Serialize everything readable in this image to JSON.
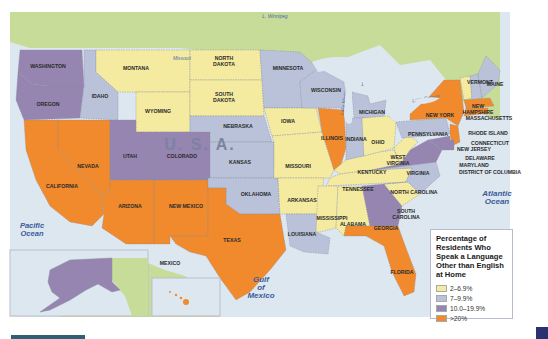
{
  "map": {
    "country_label": "U. S. A.",
    "neighbor_labels": {
      "canada_lake": "L. Winnipeg",
      "mexico": "MEXICO"
    },
    "water_labels": [
      {
        "id": "pacific",
        "text": [
          "Pacific",
          "Ocean"
        ]
      },
      {
        "id": "atlantic",
        "text": [
          "Atlantic",
          "Ocean"
        ]
      },
      {
        "id": "gulf",
        "text": [
          "Gulf",
          "of",
          "Mexico"
        ]
      }
    ],
    "lakes": [
      "Lake Superior",
      "Lake Michigan",
      "Lake Huron",
      "Lake Ontario",
      "Lake Erie"
    ],
    "river": "Missouri",
    "colors": {
      "land_other": "#c6dc98",
      "water": "#dde7f0",
      "border": "#8a8f9c"
    }
  },
  "legend": {
    "title": "Percentage of Residents Who Speak a Language Other than English at Home",
    "categories": [
      {
        "id": "c1",
        "label": "2–6.9%",
        "color": "#f5eba0"
      },
      {
        "id": "c2",
        "label": "7–9.9%",
        "color": "#b9c2d9"
      },
      {
        "id": "c3",
        "label": "10.0–19.9%",
        "color": "#9585b0"
      },
      {
        "id": "c4",
        "label": ">20%",
        "color": "#f08a2c"
      }
    ]
  },
  "chart_data": {
    "type": "choropleth",
    "title": "Percentage of Residents Who Speak a Language Other than English at Home",
    "legend_position": "bottom-right",
    "bins": [
      "2–6.9%",
      "7–9.9%",
      "10.0–19.9%",
      ">20%"
    ],
    "states": [
      {
        "name": "WASHINGTON",
        "bin": "10.0–19.9%"
      },
      {
        "name": "OREGON",
        "bin": "10.0–19.9%"
      },
      {
        "name": "CALIFORNIA",
        "bin": ">20%"
      },
      {
        "name": "NEVADA",
        "bin": ">20%"
      },
      {
        "name": "IDAHO",
        "bin": "7–9.9%"
      },
      {
        "name": "MONTANA",
        "bin": "2–6.9%"
      },
      {
        "name": "WYOMING",
        "bin": "2–6.9%"
      },
      {
        "name": "UTAH",
        "bin": "10.0–19.9%"
      },
      {
        "name": "COLORADO",
        "bin": "10.0–19.9%"
      },
      {
        "name": "ARIZONA",
        "bin": ">20%"
      },
      {
        "name": "NEW MEXICO",
        "bin": ">20%"
      },
      {
        "name": "NORTH DAKOTA",
        "bin": "2–6.9%"
      },
      {
        "name": "SOUTH DAKOTA",
        "bin": "2–6.9%"
      },
      {
        "name": "NEBRASKA",
        "bin": "7–9.9%"
      },
      {
        "name": "KANSAS",
        "bin": "7–9.9%"
      },
      {
        "name": "OKLAHOMA",
        "bin": "7–9.9%"
      },
      {
        "name": "TEXAS",
        "bin": ">20%"
      },
      {
        "name": "MINNESOTA",
        "bin": "7–9.9%"
      },
      {
        "name": "IOWA",
        "bin": "2–6.9%"
      },
      {
        "name": "MISSOURI",
        "bin": "2–6.9%"
      },
      {
        "name": "ARKANSAS",
        "bin": "2–6.9%"
      },
      {
        "name": "LOUISIANA",
        "bin": "7–9.9%"
      },
      {
        "name": "WISCONSIN",
        "bin": "7–9.9%"
      },
      {
        "name": "ILLINOIS",
        "bin": ">20%"
      },
      {
        "name": "MICHIGAN",
        "bin": "7–9.9%"
      },
      {
        "name": "INDIANA",
        "bin": "7–9.9%"
      },
      {
        "name": "OHIO",
        "bin": "2–6.9%"
      },
      {
        "name": "KENTUCKY",
        "bin": "2–6.9%"
      },
      {
        "name": "TENNESSEE",
        "bin": "2–6.9%"
      },
      {
        "name": "MISSISSIPPI",
        "bin": "2–6.9%"
      },
      {
        "name": "ALABAMA",
        "bin": "2–6.9%"
      },
      {
        "name": "GEORGIA",
        "bin": "10.0–19.9%"
      },
      {
        "name": "FLORIDA",
        "bin": ">20%"
      },
      {
        "name": "SOUTH CAROLINA",
        "bin": "2–6.9%"
      },
      {
        "name": "NORTH CAROLINA",
        "bin": "7–9.9%"
      },
      {
        "name": "VIRGINIA",
        "bin": "10.0–19.9%"
      },
      {
        "name": "WEST VIRGINIA",
        "bin": "2–6.9%"
      },
      {
        "name": "PENNSYLVANIA",
        "bin": "7–9.9%"
      },
      {
        "name": "NEW YORK",
        "bin": ">20%"
      },
      {
        "name": "VERMONT",
        "bin": "2–6.9%"
      },
      {
        "name": "NEW HAMPSHIRE",
        "bin": "7–9.9%"
      },
      {
        "name": "MAINE",
        "bin": "7–9.9%"
      },
      {
        "name": "MASSACHUSETTS",
        "bin": ">20%"
      },
      {
        "name": "RHODE ISLAND",
        "bin": ">20%"
      },
      {
        "name": "CONNECTICUT",
        "bin": ">20%"
      },
      {
        "name": "NEW JERSEY",
        "bin": ">20%"
      },
      {
        "name": "DELAWARE",
        "bin": "10.0–19.9%"
      },
      {
        "name": "MARYLAND",
        "bin": "10.0–19.9%"
      },
      {
        "name": "DISTRICT OF COLUMBIA",
        "bin": "10.0–19.9%"
      },
      {
        "name": "ALASKA",
        "bin": "10.0–19.9%"
      },
      {
        "name": "HAWAII",
        "bin": ">20%"
      }
    ]
  }
}
